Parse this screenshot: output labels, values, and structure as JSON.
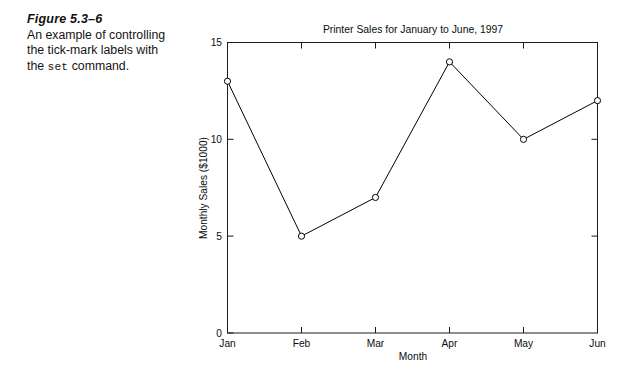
{
  "caption": {
    "heading": "Figure 5.3–6",
    "line1": "An example of controlling",
    "line2": "the tick-mark labels with",
    "line3_before": "the ",
    "line3_code": "set",
    "line3_after": " command."
  },
  "chart_data": {
    "type": "line",
    "title": "Printer Sales for January to June, 1997",
    "xlabel": "Month",
    "ylabel": "Monthly Sales ($1000)",
    "categories": [
      "Jan",
      "Feb",
      "Mar",
      "Apr",
      "May",
      "Jun"
    ],
    "values": [
      13,
      5,
      7,
      14,
      10,
      12
    ],
    "ylim": [
      0,
      15
    ],
    "yticks": [
      0,
      5,
      10,
      15
    ],
    "ytick_labels": [
      "0",
      "5",
      "10",
      "15"
    ],
    "xtick_labels": [
      "Jan",
      "Feb",
      "Mar",
      "Apr",
      "May",
      "Jun"
    ],
    "grid": false,
    "legend": false,
    "marker": "open-circle",
    "line_color": "#000000",
    "frame": "box-with-inward-ticks"
  },
  "axis_ticks": {
    "y0": "0",
    "y1": "5",
    "y2": "10",
    "y3": "15",
    "x0": "Jan",
    "x1": "Feb",
    "x2": "Mar",
    "x3": "Apr",
    "x4": "May",
    "x5": "Jun"
  }
}
